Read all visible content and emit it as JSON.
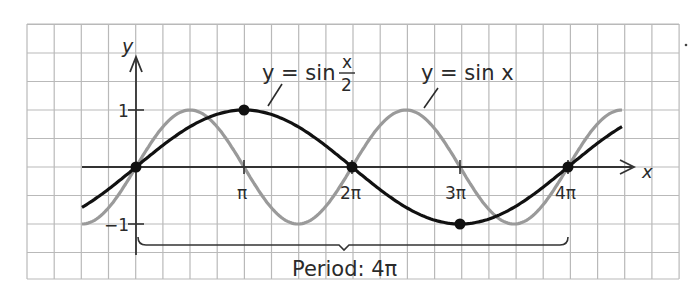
{
  "chart_data": {
    "type": "line",
    "title": "",
    "xlabel": "x",
    "ylabel": "y",
    "x_ticks": [
      "π",
      "2π",
      "3π",
      "4π"
    ],
    "x_tick_values": [
      3.1416,
      6.2832,
      9.4248,
      12.5664
    ],
    "y_ticks": [
      "1",
      "−1"
    ],
    "y_tick_values": [
      1,
      -1
    ],
    "xlim": [
      -1.5708,
      14.1372
    ],
    "ylim": [
      -1,
      1
    ],
    "grid": true,
    "series": [
      {
        "name": "y = sin x/2",
        "color": "#111111",
        "function": "sin(x/2)",
        "x": [
          -1.5708,
          0,
          1.5708,
          3.1416,
          4.7124,
          6.2832,
          7.854,
          9.4248,
          10.9956,
          12.5664,
          14.1372
        ],
        "values": [
          -0.707,
          0,
          0.707,
          1,
          0.707,
          0,
          -0.707,
          -1,
          -0.707,
          0,
          0.707
        ],
        "marked_points": [
          {
            "x": "0",
            "y": 0
          },
          {
            "x": "π",
            "y": 1
          },
          {
            "x": "2π",
            "y": 0
          },
          {
            "x": "3π",
            "y": -1
          },
          {
            "x": "4π",
            "y": 0
          }
        ]
      },
      {
        "name": "y = sin x",
        "color": "#9a9a9a",
        "function": "sin(x)",
        "x": [
          -1.5708,
          0,
          1.5708,
          3.1416,
          4.7124,
          6.2832,
          7.854,
          9.4248,
          10.9956,
          12.5664,
          14.1372
        ],
        "values": [
          -1,
          0,
          1,
          0,
          -1,
          0,
          1,
          0,
          -1,
          0,
          1
        ]
      }
    ],
    "annotations": [
      {
        "text": "y = sin x/2",
        "target": "black curve"
      },
      {
        "text": "y = sin x",
        "target": "gray curve"
      },
      {
        "text": "Period: 4π",
        "type": "brace",
        "from": "0",
        "to": "4π"
      }
    ]
  },
  "labels": {
    "y_axis": "y",
    "x_axis": "x",
    "tick_one": "1",
    "tick_neg_one": "−1",
    "tick_pi": "π",
    "tick_2pi": "2π",
    "tick_3pi": "3π",
    "tick_4pi": "4π",
    "label_sin_half_prefix": "y = sin",
    "label_sin_half_num": "x",
    "label_sin_half_den": "2",
    "label_sin_x": "y = sin x",
    "period": "Period: 4π"
  },
  "colors": {
    "grid": "#b9b9b9",
    "axis": "#333333",
    "sin_half": "#111111",
    "sin_x": "#9a9a9a"
  }
}
